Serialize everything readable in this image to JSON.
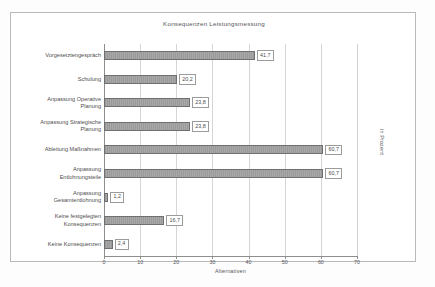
{
  "figure": {
    "title": "Konsequenzen Leistungsmessung",
    "right_axis_label": "in Prozent",
    "caption": "Abbildung 60: Konsequenzen der Leistungsmessung"
  },
  "chart_data": {
    "type": "bar",
    "orientation": "horizontal",
    "title": "Konsequenzen Leistungsmessung",
    "xlabel": "Alternativen",
    "ylabel": "",
    "secondary_label": "in Prozent",
    "xlim": [
      0,
      70
    ],
    "xticks": [
      0,
      10,
      20,
      30,
      40,
      50,
      60,
      70
    ],
    "xtick_labels": [
      "0",
      "10",
      "20",
      "30",
      "40",
      "50",
      "60",
      "70"
    ],
    "grid": true,
    "legend": false,
    "bar_color": "#a0a0a0",
    "bar_edge_color": "#6f6f6f",
    "categories": [
      "Vorgesetztengespräch",
      "Schulung",
      "Anpassung Operative Planung",
      "Anpassung Strategische Planung",
      "Ableitung Maßnahmen",
      "Anpassung Entlohnungsteile",
      "Anpassung Gesamtentlohnung",
      "Keine festgelegten Konsequenzen",
      "Keine Konsequenzen"
    ],
    "values": [
      41.7,
      20.2,
      23.8,
      23.8,
      60.7,
      60.7,
      1.2,
      16.7,
      2.4
    ],
    "value_labels": [
      "41,7",
      "20,2",
      "23,8",
      "23,8",
      "60,7",
      "60,7",
      "1,2",
      "16,7",
      "2,4"
    ]
  },
  "categories_display": [
    {
      "lines": [
        "Vorgesetztengespräch"
      ]
    },
    {
      "lines": [
        "Schulung"
      ]
    },
    {
      "lines": [
        "Anpassung Operative",
        "Planung"
      ]
    },
    {
      "lines": [
        "Anpassung Strategische",
        "Planung"
      ]
    },
    {
      "lines": [
        "Ableitung Maßnahmen"
      ]
    },
    {
      "lines": [
        "Anpassung",
        "Entlohnungsteile"
      ]
    },
    {
      "lines": [
        "Anpassung",
        "Gesamtentlohnung"
      ]
    },
    {
      "lines": [
        "Keine festgelegten",
        "Konsequenzen"
      ]
    },
    {
      "lines": [
        "Keine Konsequenzen"
      ]
    }
  ]
}
